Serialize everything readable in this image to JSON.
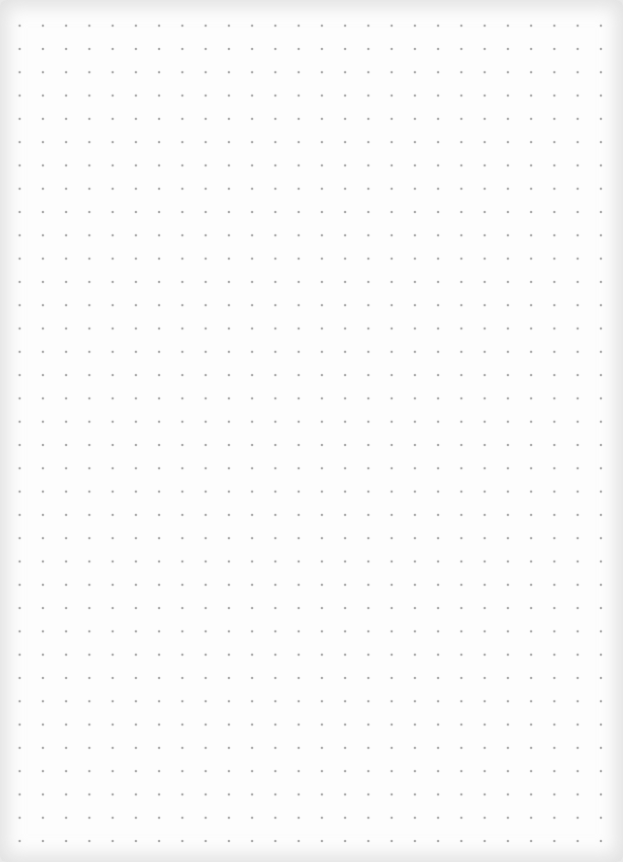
{
  "page": {
    "type": "dot-grid-paper",
    "columns": 26,
    "rows": 36,
    "dot_spacing_px": 23.3,
    "dot_color": "#a9a9a9",
    "paper_color": "#fdfdfd",
    "edge_color": "#e9e9e9"
  }
}
